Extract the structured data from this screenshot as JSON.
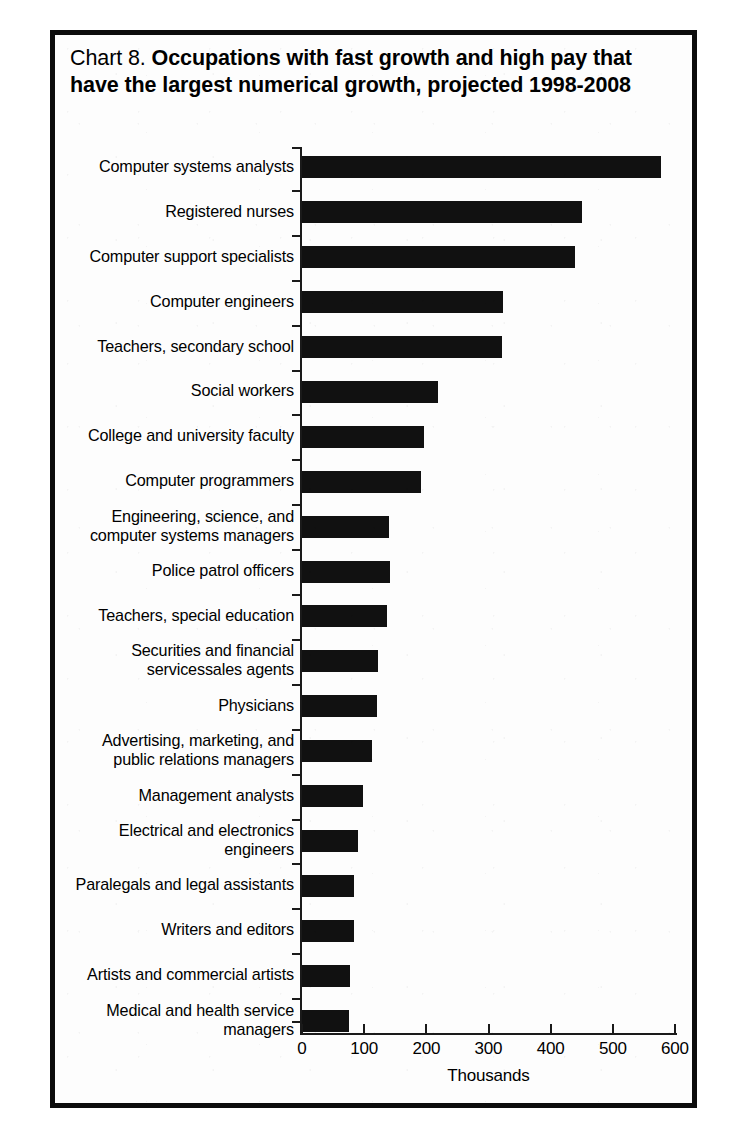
{
  "figure": {
    "title_prefix": "Chart 8.  ",
    "title_main": "Occupations with fast growth and high pay that have the largest numerical growth, projected 1998-2008",
    "frame_color": "#0c0c0c",
    "bar_color": "#111111",
    "background_color": "#fdfdfd"
  },
  "chart_data": {
    "type": "bar",
    "orientation": "horizontal",
    "title": "Chart 8.  Occupations with fast growth and high pay that have the largest numerical growth, projected 1998-2008",
    "xlabel": "Thousands",
    "ylabel": "",
    "xlim": [
      0,
      600
    ],
    "xticks": [
      0,
      100,
      200,
      300,
      400,
      500,
      600
    ],
    "xtick_labels": [
      "0",
      "100",
      "200",
      "300",
      "400",
      "500",
      "600"
    ],
    "grid": false,
    "legend": null,
    "units": "thousands of jobs",
    "categories": [
      "Computer systems analysts",
      "Registered nurses",
      "Computer support specialists",
      "Computer engineers",
      "Teachers, secondary school",
      "Social workers",
      "College and university faculty",
      "Computer programmers",
      "Engineering, science, and\ncomputer systems managers",
      "Police patrol officers",
      "Teachers, special education",
      "Securities and financial\nservicessales agents",
      "Physicians",
      "Advertising, marketing, and\npublic relations managers",
      "Management analysts",
      "Electrical and electronics\nengineers",
      "Paralegals and legal assistants",
      "Writers and editors",
      "Artists and commercial artists",
      "Medical and health service\nmanagers"
    ],
    "values": [
      577,
      451,
      439,
      323,
      322,
      218,
      196,
      191,
      140,
      142,
      137,
      122,
      121,
      112,
      98,
      90,
      84,
      83,
      78,
      75
    ]
  }
}
